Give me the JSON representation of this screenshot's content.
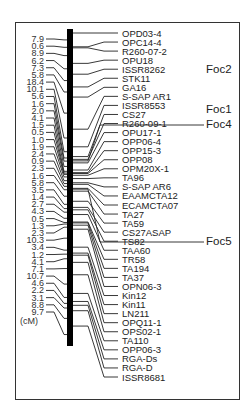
{
  "figure": {
    "type": "genetic-linkage-map",
    "unit_label": "(cM)",
    "colors": {
      "chromosome": "#000000",
      "lines": "#222222",
      "frame": "#333333"
    }
  },
  "intervals_cM": [
    "7.9",
    "0.6",
    "8.9",
    "6.2",
    "7.3",
    "5.8",
    "18.4",
    "10.1",
    "5.6",
    "1.6",
    "2.0",
    "4.1",
    "1.5",
    "0.5",
    "1.0",
    "1.9",
    "2.4",
    "0.9",
    "2.3",
    "1.6",
    "5.8",
    "3.5",
    "1.4",
    "2.7",
    "4.3",
    "0.5",
    "1.3",
    "2.3",
    "10.3",
    "3.4",
    "1.2",
    "4.1",
    "7.1",
    "10.7",
    "4.6",
    "2.2",
    "3.1",
    "8.8",
    "9.7"
  ],
  "markers": [
    "OPD03-4",
    "OPC14-4",
    "R260-07-2",
    "OPU18",
    "ISSR8262",
    "STK11",
    "GA16",
    "S-SAP AR1",
    "ISSR8553",
    "CS27",
    "R260-09-1",
    "OPU17-1",
    "OPP06-4",
    "OPP15-3",
    "OPP08",
    "OPM20X-1",
    "TA96",
    "S-SAP AR6",
    "EAAMCTA12",
    "ECAMCTA07",
    "TA27",
    "TA59",
    "CS27ASAP",
    "TS82",
    "TAA60",
    "TR58",
    "TA194",
    "TA37",
    "OPN06-3",
    "Kin12",
    "Kin11",
    "LN211",
    "OPQ11-1",
    "OPS02-1",
    "TA110",
    "OPP06-3",
    "RGA-Ds",
    "RGA-D",
    "ISSR8681"
  ],
  "resistance_loci": [
    {
      "label": "Foc2",
      "near_marker": "STK11"
    },
    {
      "label": "Foc1",
      "near_marker": "CS27"
    },
    {
      "label": "Foc4",
      "near_marker": "R260-09-1"
    },
    {
      "label": "Foc5",
      "near_marker": "ECAMCTA07"
    }
  ]
}
